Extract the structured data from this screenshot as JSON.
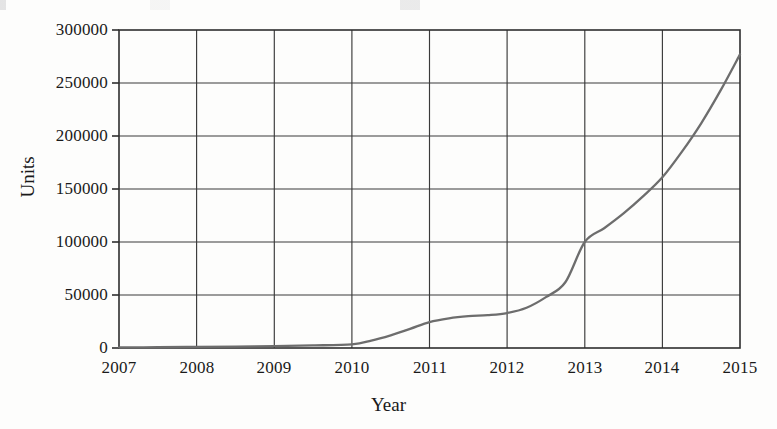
{
  "figure": {
    "background_color": "#fdfdfc",
    "axis_color": "#2e2e2e",
    "grid_color": "#3a3a3a",
    "series_color": "#6d6d6d"
  },
  "chart_data": {
    "type": "line",
    "title": "",
    "xlabel": "Year",
    "ylabel": "Units",
    "xlim": [
      2007,
      2015
    ],
    "ylim": [
      0,
      300000
    ],
    "grid": true,
    "legend": "none",
    "x_tick_labels": [
      "2007",
      "2008",
      "2009",
      "2010",
      "2011",
      "2012",
      "2013",
      "2014",
      "2015"
    ],
    "y_tick_labels": [
      "0",
      "50000",
      "100000",
      "150000",
      "200000",
      "250000",
      "300000"
    ],
    "x_ticks": [
      2007,
      2008,
      2009,
      2010,
      2011,
      2012,
      2013,
      2014,
      2015
    ],
    "y_ticks": [
      0,
      50000,
      100000,
      150000,
      200000,
      250000,
      300000
    ],
    "series": [
      {
        "name": "Units",
        "color": "#6d6d6d",
        "x": [
          2007,
          2007.5,
          2008,
          2008.5,
          2009,
          2009.5,
          2010,
          2010.25,
          2010.5,
          2010.75,
          2011,
          2011.25,
          2011.5,
          2011.75,
          2012,
          2012.25,
          2012.5,
          2012.75,
          2013,
          2013.25,
          2013.5,
          2013.75,
          2014,
          2014.25,
          2014.5,
          2014.75,
          2015
        ],
        "y": [
          500,
          700,
          1000,
          1300,
          1800,
          2400,
          3500,
          7000,
          12000,
          18000,
          24500,
          28000,
          30000,
          31000,
          33000,
          38000,
          48000,
          62000,
          100000,
          113000,
          127000,
          143000,
          161000,
          185000,
          212000,
          243000,
          277000
        ],
        "values_at_year_ticks": [
          500,
          1000,
          1800,
          3500,
          24500,
          33000,
          100000,
          161000,
          277000
        ]
      }
    ]
  }
}
